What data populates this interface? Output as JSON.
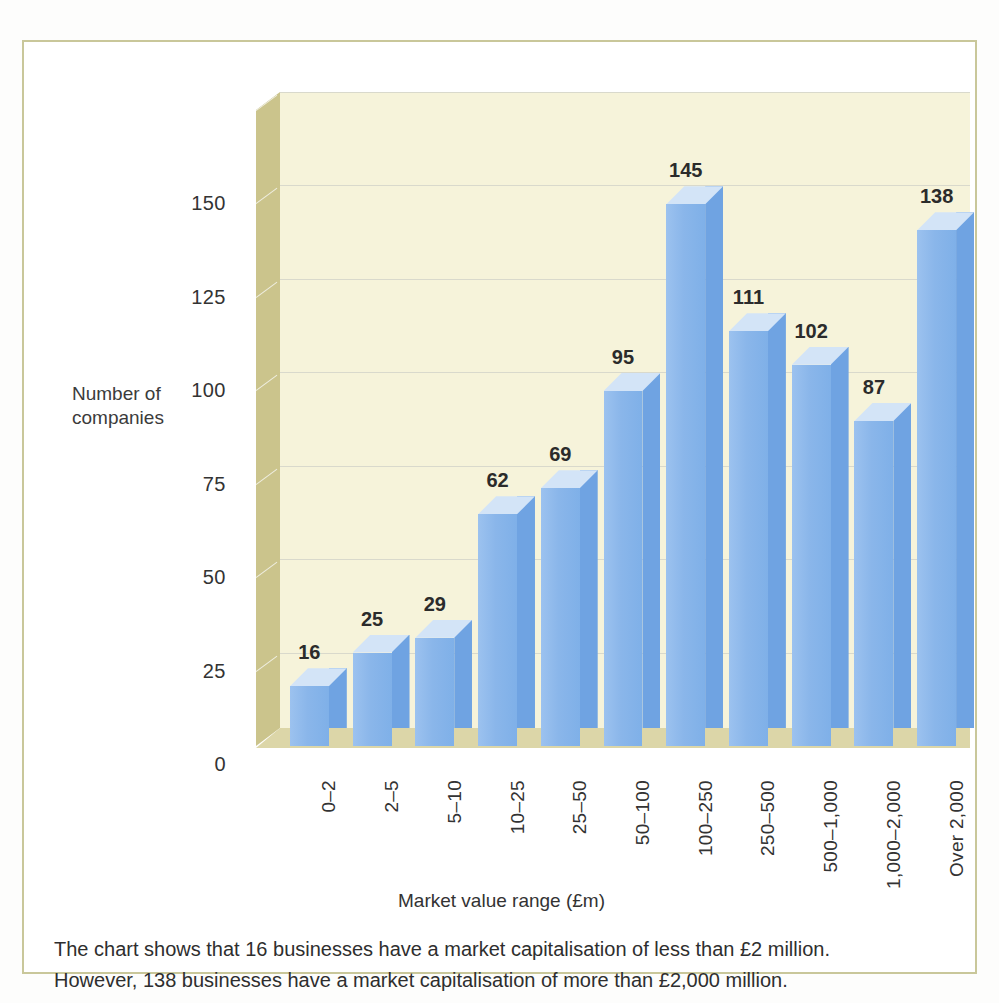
{
  "chart_data": {
    "type": "bar",
    "title": "",
    "xlabel": "Market value range (£m)",
    "ylabel": "Number of companies",
    "ylabel_line1": "Number of",
    "ylabel_line2": "companies",
    "categories": [
      "0–2",
      "2–5",
      "5–10",
      "10–25",
      "25–50",
      "50–100",
      "100–250",
      "250–500",
      "500–1,000",
      "1,000–2,000",
      "Over 2,000"
    ],
    "values": [
      16,
      25,
      29,
      62,
      69,
      95,
      145,
      111,
      102,
      87,
      138
    ],
    "yticks": [
      0,
      25,
      50,
      75,
      100,
      125,
      150
    ],
    "ylim": [
      0,
      175
    ],
    "grid": true,
    "legend": "none",
    "style": "3d-column",
    "colors": {
      "bar_front": "#8ab6ea",
      "bar_side": "#6fa3e2",
      "bar_top": "#d3e4f7",
      "plot_background": "#f6f3da",
      "wall": "#cbc48c",
      "floor": "#dcd6a8",
      "gridline": "#d9d9cc",
      "frame_border": "#c9c79a",
      "text": "#2e2e2e"
    }
  },
  "caption": {
    "line1": "The chart shows that 16 businesses have a market capitalisation of less than £2 million.",
    "line2": "However, 138 businesses have a market capitalisation of more than £2,000 million."
  }
}
